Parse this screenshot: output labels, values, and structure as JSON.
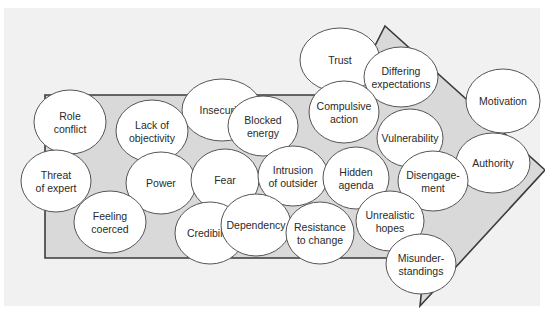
{
  "diagram": {
    "type": "arrow-with-overlapping-bubbles",
    "colors": {
      "background": "#f1f1f1",
      "border": "#ffffff",
      "arrow_fill": "#d9d9d9",
      "arrow_stroke": "#3a3a3a",
      "bubble_fill": "#ffffff",
      "bubble_stroke": "#555555",
      "text": "#2a2a2a"
    },
    "arrow": {
      "points": "45,95 350,95 385,26 545,170 420,306 425,258 45,258"
    },
    "bubbles": [
      {
        "id": "trust",
        "lines": [
          "Trust"
        ],
        "cx": 340,
        "cy": 60,
        "rx": 40,
        "ry": 32
      },
      {
        "id": "differing-expectations",
        "lines": [
          "Differing",
          "expectations"
        ],
        "cx": 401,
        "cy": 77,
        "rx": 37,
        "ry": 30
      },
      {
        "id": "motivation",
        "lines": [
          "Motivation"
        ],
        "cx": 503,
        "cy": 101,
        "rx": 37,
        "ry": 32
      },
      {
        "id": "role-conflict",
        "lines": [
          "Role",
          "conflict"
        ],
        "cx": 70,
        "cy": 122,
        "rx": 36,
        "ry": 32
      },
      {
        "id": "insecurity",
        "lines": [
          "Insecurity"
        ],
        "cx": 222,
        "cy": 110,
        "rx": 40,
        "ry": 31
      },
      {
        "id": "compulsive-action",
        "lines": [
          "Compulsive",
          "action"
        ],
        "cx": 344,
        "cy": 112,
        "rx": 35,
        "ry": 31
      },
      {
        "id": "blocked-energy",
        "lines": [
          "Blocked",
          "energy"
        ],
        "cx": 263,
        "cy": 126,
        "rx": 35,
        "ry": 30
      },
      {
        "id": "lack-of-objectivity",
        "lines": [
          "Lack of",
          "objectivity"
        ],
        "cx": 152,
        "cy": 131,
        "rx": 36,
        "ry": 31
      },
      {
        "id": "vulnerability",
        "lines": [
          "Vulnerability"
        ],
        "cx": 410,
        "cy": 138,
        "rx": 33,
        "ry": 29
      },
      {
        "id": "authority",
        "lines": [
          "Authority"
        ],
        "cx": 493,
        "cy": 163,
        "rx": 37,
        "ry": 30
      },
      {
        "id": "threat-of-expert",
        "lines": [
          "Threat",
          "of expert"
        ],
        "cx": 56,
        "cy": 181,
        "rx": 35,
        "ry": 31
      },
      {
        "id": "power",
        "lines": [
          "Power"
        ],
        "cx": 161,
        "cy": 183,
        "rx": 35,
        "ry": 31
      },
      {
        "id": "fear",
        "lines": [
          "Fear"
        ],
        "cx": 225,
        "cy": 180,
        "rx": 34,
        "ry": 31
      },
      {
        "id": "intrusion-of-outsider",
        "lines": [
          "Intrusion",
          "of outsider"
        ],
        "cx": 293,
        "cy": 176,
        "rx": 35,
        "ry": 30
      },
      {
        "id": "hidden-agenda",
        "lines": [
          "Hidden",
          "agenda"
        ],
        "cx": 356,
        "cy": 178,
        "rx": 33,
        "ry": 31
      },
      {
        "id": "disengagement",
        "lines": [
          "Disengage-",
          "ment"
        ],
        "cx": 433,
        "cy": 181,
        "rx": 35,
        "ry": 30
      },
      {
        "id": "feeling-coerced",
        "lines": [
          "Feeling",
          "coerced"
        ],
        "cx": 110,
        "cy": 222,
        "rx": 36,
        "ry": 31
      },
      {
        "id": "credibility",
        "lines": [
          "Credibility"
        ],
        "cx": 210,
        "cy": 233,
        "rx": 35,
        "ry": 31
      },
      {
        "id": "dependency",
        "lines": [
          "Dependency"
        ],
        "cx": 256,
        "cy": 225,
        "rx": 35,
        "ry": 31
      },
      {
        "id": "resistance-to-change",
        "lines": [
          "Resistance",
          "to change"
        ],
        "cx": 320,
        "cy": 233,
        "rx": 34,
        "ry": 31
      },
      {
        "id": "unrealistic-hopes",
        "lines": [
          "Unrealistic",
          "hopes"
        ],
        "cx": 390,
        "cy": 221,
        "rx": 34,
        "ry": 30
      },
      {
        "id": "misunderstandings",
        "lines": [
          "Misunder-",
          "standings"
        ],
        "cx": 421,
        "cy": 264,
        "rx": 35,
        "ry": 30
      }
    ]
  }
}
